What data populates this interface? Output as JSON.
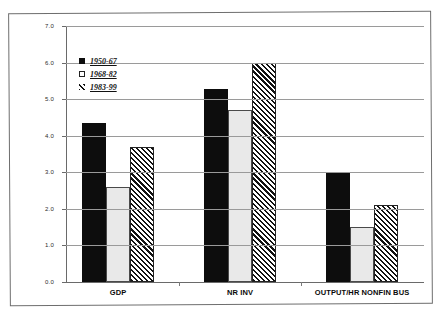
{
  "chart_data": {
    "type": "bar",
    "title": "",
    "xlabel": "",
    "ylabel": "",
    "ylim": [
      0.0,
      7.0
    ],
    "ytick_step": 1.0,
    "grid": true,
    "legend_position": "upper-left-inside",
    "categories": [
      "GDP",
      "NR INV",
      "OUTPUT/HR NONFIN BUS"
    ],
    "ticks": [
      "0.0",
      "1.0",
      "2.0",
      "3.0",
      "4.0",
      "5.0",
      "6.0",
      "7.0"
    ],
    "series": [
      {
        "name": "1950-67",
        "fill": "solid-black",
        "color": "#0d0d0d",
        "values": [
          4.35,
          5.27,
          3.0
        ]
      },
      {
        "name": "1968-82",
        "fill": "white",
        "color": "#e9e9e9",
        "values": [
          2.6,
          4.7,
          1.5
        ]
      },
      {
        "name": "1983-99",
        "fill": "diagonal-hatch",
        "color": "#111111",
        "values": [
          3.7,
          6.0,
          2.1
        ]
      }
    ]
  }
}
